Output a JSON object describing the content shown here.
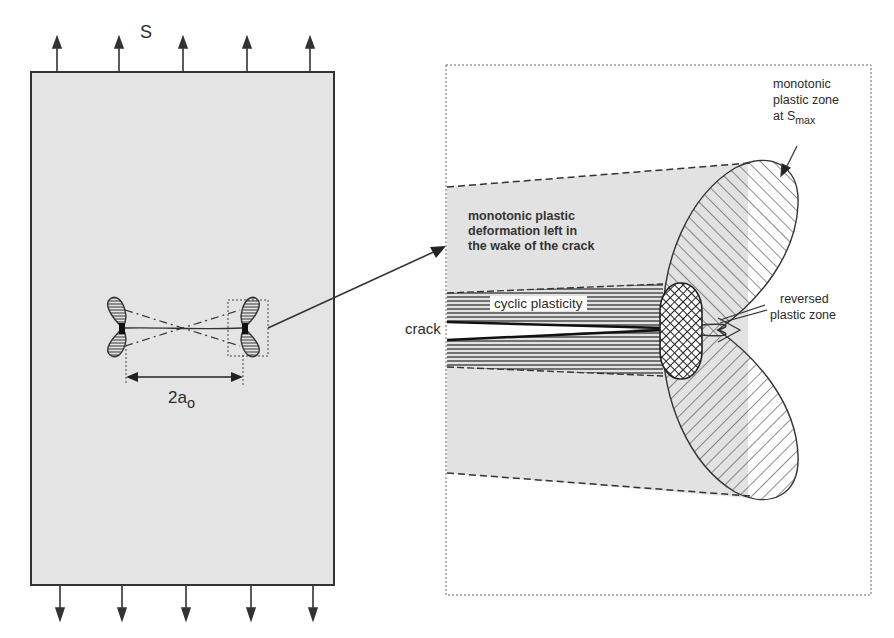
{
  "diagram": {
    "type": "fatigue crack plasticity schematic",
    "left_panel": {
      "load_label": "S",
      "crack_length_label": "2a",
      "crack_length_subscript": "o",
      "top_arrow_count": 5,
      "bottom_arrow_count": 5,
      "plate_fill": "#e4e4e4"
    },
    "right_panel": {
      "zone_label_line1": "monotonic",
      "zone_label_line2": "plastic zone",
      "zone_label_line3_prefix": "at S",
      "zone_label_line3_subscript": "max",
      "wake_label_line1": "monotonic plastic",
      "wake_label_line2": "deformation left in",
      "wake_label_line3": "the wake of the crack",
      "cyclic_label": "cyclic plasticity",
      "crack_label": "crack",
      "reversed_label_line1": "reversed",
      "reversed_label_line2": "plastic zone"
    },
    "colors": {
      "line": "#333333",
      "shade": "#e2e2e2",
      "background": "#ffffff"
    }
  }
}
